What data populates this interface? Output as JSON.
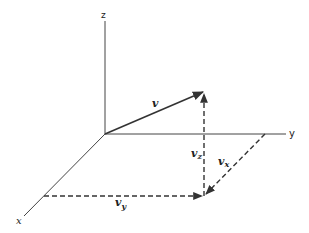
{
  "diagram": {
    "type": "3d vector decomposition",
    "axes": {
      "z": {
        "label": "z"
      },
      "y": {
        "label": "y"
      },
      "x": {
        "label": "x"
      }
    },
    "vector": {
      "label": "v"
    },
    "components": {
      "vz": {
        "label": "v",
        "subscript": "z"
      },
      "vx": {
        "label": "v",
        "subscript": "x"
      },
      "vy": {
        "label": "v",
        "subscript": "y"
      }
    },
    "colors": {
      "line": "#333333",
      "background": "#ffffff"
    }
  }
}
